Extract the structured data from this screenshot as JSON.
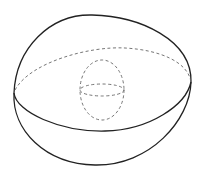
{
  "diagram": {
    "title": "",
    "colors": {
      "background": "#ffffff",
      "stroke_solid": "#222222",
      "stroke_dashed": "#666666"
    },
    "shapes": {
      "outer_contour": "solid",
      "equator_front": "solid",
      "equator_back": "dashed",
      "inner_vertical": "dashed",
      "inner_equator": "dashed"
    }
  }
}
